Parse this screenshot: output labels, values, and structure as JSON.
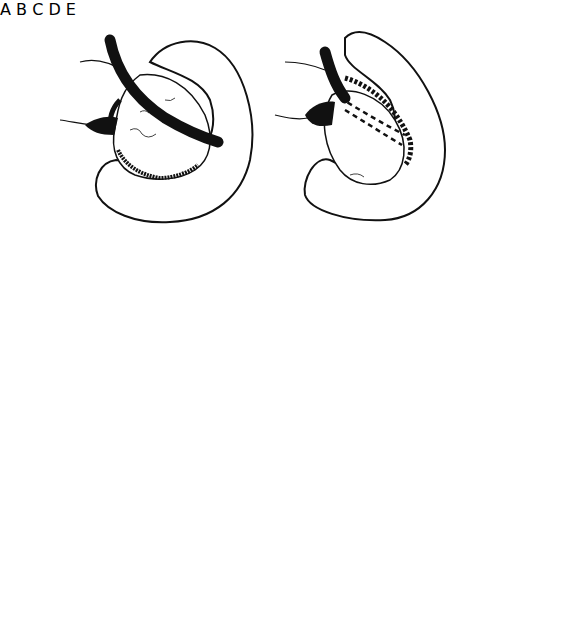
{
  "figure": {
    "type": "surgical-illustration",
    "colors": {
      "ink": "#111111",
      "background": "#ffffff"
    },
    "panels": [
      {
        "id": "A",
        "label": "A",
        "tube_style": "solid-over-mass",
        "cross_section": "none"
      },
      {
        "id": "B",
        "label": "B",
        "tube_style": "dashed-under-mass",
        "cross_section": "tube-wrapped-by-flap"
      },
      {
        "id": "C",
        "label": "C",
        "tube_style": "dashed-under-mass",
        "cross_section": "tube-below-line"
      },
      {
        "id": "D",
        "label": "D",
        "tube_style": "solid-over-mass",
        "cross_section": "tube-on-line"
      },
      {
        "id": "E",
        "label": "E",
        "tube_style": "solid-partially-buried",
        "cross_section": "tube-enfolded"
      }
    ]
  }
}
